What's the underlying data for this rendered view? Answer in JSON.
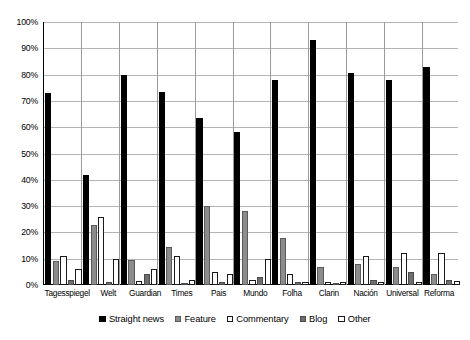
{
  "chart_data": {
    "type": "bar",
    "title": "",
    "xlabel": "",
    "ylabel": "",
    "ylim": [
      0,
      100
    ],
    "yticks": [
      "0%",
      "10%",
      "20%",
      "30%",
      "40%",
      "50%",
      "60%",
      "70%",
      "80%",
      "90%",
      "100%"
    ],
    "grid": true,
    "legend_position": "bottom",
    "categories": [
      "Tagesspiegel",
      "Welt",
      "Guardian",
      "Times",
      "Pais",
      "Mundo",
      "Folha",
      "Clarin",
      "Nación",
      "Universal",
      "Reforma"
    ],
    "series": [
      {
        "name": "Straight news",
        "color": "#000000",
        "values": [
          73,
          42,
          80,
          73.5,
          63.5,
          58,
          78,
          93,
          80.5,
          78,
          83
        ]
      },
      {
        "name": "Feature",
        "color": "#8c8c8c",
        "values": [
          9,
          23,
          9.5,
          14.5,
          30,
          28,
          18,
          7,
          8,
          7,
          4
        ]
      },
      {
        "name": "Commentary",
        "color": "#ffffff",
        "values": [
          11,
          26,
          1.5,
          11,
          5,
          2,
          4,
          1,
          11,
          12,
          12
        ]
      },
      {
        "name": "Blog",
        "color": "#6e6e6e",
        "values": [
          2,
          1,
          4,
          0.5,
          1,
          3,
          1,
          0.5,
          2,
          5,
          2
        ]
      },
      {
        "name": "Other",
        "color": "#ffffff",
        "values": [
          6,
          10,
          6,
          2,
          4,
          10,
          1,
          1,
          1,
          1,
          1.5
        ]
      }
    ]
  }
}
